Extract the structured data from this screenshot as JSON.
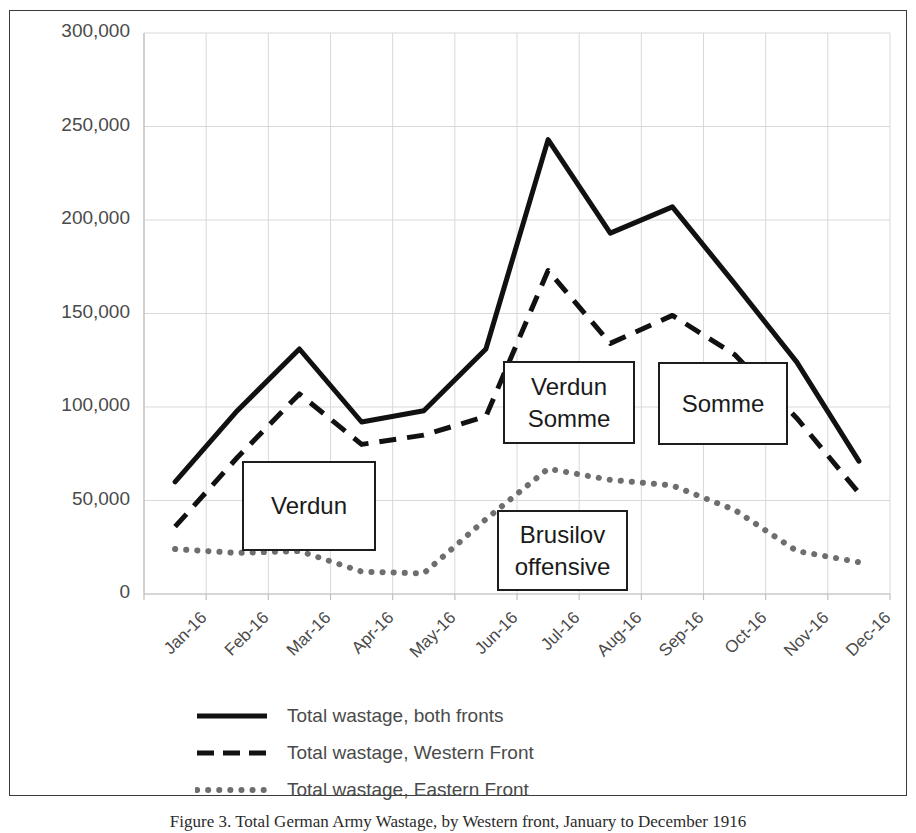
{
  "chart_data": {
    "type": "line",
    "title": "",
    "xlabel": "",
    "ylabel": "",
    "categories": [
      "Jan-16",
      "Feb-16",
      "Mar-16",
      "Apr-16",
      "May-16",
      "Jun-16",
      "Jul-16",
      "Aug-16",
      "Sep-16",
      "Oct-16",
      "Nov-16",
      "Dec-16"
    ],
    "ylim": [
      0,
      300000
    ],
    "yticks": [
      0,
      50000,
      100000,
      150000,
      200000,
      250000,
      300000
    ],
    "ytick_labels": [
      "0",
      "50,000",
      "100,000",
      "150,000",
      "200,000",
      "250,000",
      "300,000"
    ],
    "grid": true,
    "legend_position": "bottom",
    "series": [
      {
        "name": "Total wastage, both fronts",
        "style": "solid",
        "color": "#111111",
        "width": 5,
        "values": [
          60000,
          98000,
          131000,
          92000,
          98000,
          131000,
          243000,
          193000,
          207000,
          166000,
          124000,
          71000
        ]
      },
      {
        "name": "Total wastage, Western Front",
        "style": "dashed",
        "color": "#111111",
        "width": 5,
        "values": [
          36000,
          73000,
          107000,
          80000,
          85000,
          95000,
          173000,
          134000,
          149000,
          128000,
          94000,
          54000
        ]
      },
      {
        "name": "Total wastage, Eastern Front",
        "style": "dotted",
        "color": "#6e6e6e",
        "width": 6,
        "values": [
          24000,
          22000,
          23000,
          12000,
          11000,
          40000,
          67000,
          61000,
          58000,
          45000,
          23000,
          17000
        ]
      }
    ],
    "annotations": [
      {
        "id": "verdun",
        "lines": [
          "Verdun"
        ],
        "x": 242,
        "y": 461,
        "w": 134,
        "h": 90
      },
      {
        "id": "verdun-somme",
        "lines": [
          "Verdun",
          "Somme"
        ],
        "x": 503,
        "y": 361,
        "w": 132,
        "h": 83
      },
      {
        "id": "somme",
        "lines": [
          "Somme"
        ],
        "x": 658,
        "y": 362,
        "w": 130,
        "h": 83
      },
      {
        "id": "brusilov",
        "lines": [
          "Brusilov",
          "offensive"
        ],
        "x": 497,
        "y": 510,
        "w": 131,
        "h": 81
      }
    ]
  },
  "legend": {
    "items": [
      {
        "label": "Total wastage, both fronts",
        "marker": "solid-line-swatch"
      },
      {
        "label": "Total wastage, Western Front",
        "marker": "dashed-line-swatch"
      },
      {
        "label": "Total wastage, Eastern Front",
        "marker": "dotted-line-swatch"
      }
    ]
  },
  "caption": {
    "text": "Figure 3. Total German Army Wastage, by Western front, January to December 1916"
  },
  "colors": {
    "line_black": "#111111",
    "line_gray": "#6e6e6e",
    "grid": "#d9d9d9",
    "axis": "#bfbfbf",
    "text": "#4a4a4a",
    "frame": "#3a3a3a"
  }
}
